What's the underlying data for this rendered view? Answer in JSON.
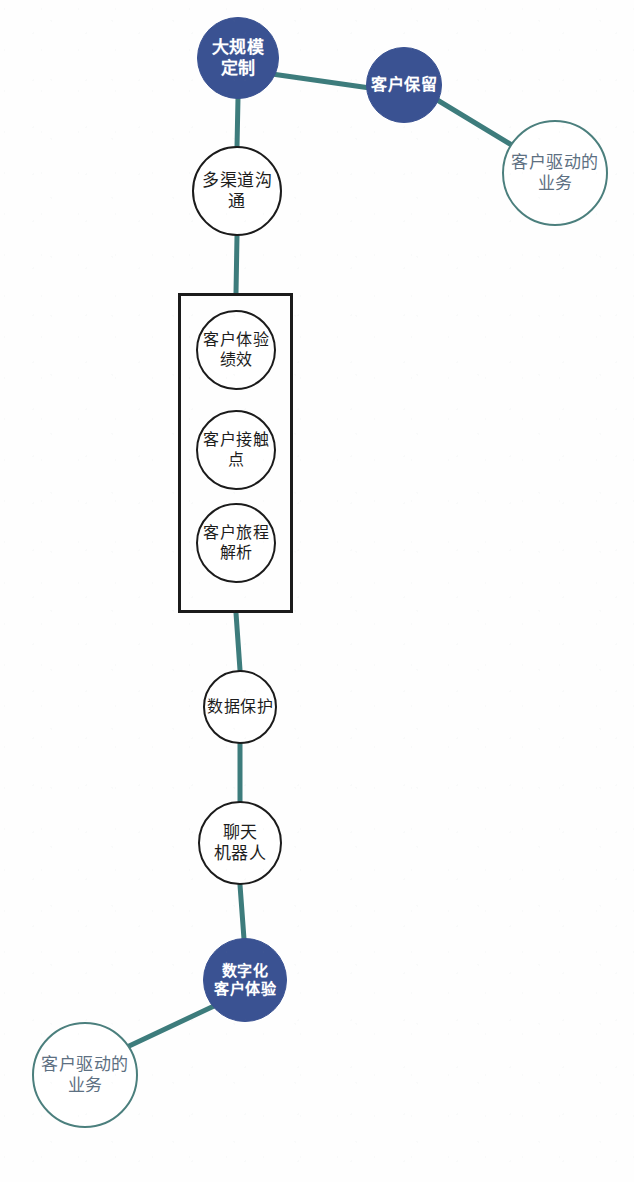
{
  "diagram": {
    "canvas": {
      "width": 634,
      "height": 1182,
      "background": "#fefefe"
    },
    "colors": {
      "filled_node_fill": "#3a5292",
      "filled_node_text": "#ffffff",
      "outline_dark_border": "#1b1b1b",
      "outline_dark_text": "#1d1d1d",
      "outline_teal_border": "#4b7f7d",
      "outline_teal_text": "#5d7082",
      "edge": "#3d7c7c",
      "group_box_border": "#1b1b1b"
    },
    "nodes": [
      {
        "id": "mass-customization",
        "label": "大规模\n定制",
        "style": "filled",
        "cx": 238,
        "cy": 58,
        "r": 41,
        "font_size": 17
      },
      {
        "id": "customer-retention",
        "label": "客户保留",
        "style": "filled",
        "cx": 404,
        "cy": 85,
        "r": 38,
        "font_size": 16
      },
      {
        "id": "customer-driven-business-top",
        "label": "客户驱动的\n业务",
        "style": "outline-teal",
        "cx": 555,
        "cy": 173,
        "r": 53,
        "font_size": 17
      },
      {
        "id": "multichannel-communication",
        "label": "多渠道沟\n通",
        "style": "outline-dark",
        "cx": 237,
        "cy": 191,
        "r": 45,
        "font_size": 17
      },
      {
        "id": "cx-performance",
        "label": "客户体验\n绩效",
        "style": "outline-dark",
        "cx": 236,
        "cy": 350,
        "r": 40,
        "font_size": 16
      },
      {
        "id": "customer-touchpoints",
        "label": "客户接触\n点",
        "style": "outline-dark",
        "cx": 236,
        "cy": 450,
        "r": 40,
        "font_size": 16
      },
      {
        "id": "customer-journey-analysis",
        "label": "客户旅程\n解析",
        "style": "outline-dark",
        "cx": 236,
        "cy": 543,
        "r": 40,
        "font_size": 16
      },
      {
        "id": "data-protection",
        "label": "数据保护",
        "style": "outline-dark",
        "cx": 240,
        "cy": 707,
        "r": 37,
        "font_size": 16
      },
      {
        "id": "chatbot",
        "label": "聊天\n机器人",
        "style": "outline-dark",
        "cx": 240,
        "cy": 843,
        "r": 42,
        "font_size": 17
      },
      {
        "id": "digital-cx",
        "label": "数字化\n客户体验",
        "style": "filled",
        "cx": 245,
        "cy": 980,
        "r": 42,
        "font_size": 15
      },
      {
        "id": "customer-driven-business-bottom",
        "label": "客户驱动的\n业务",
        "style": "outline-teal",
        "cx": 85,
        "cy": 1075,
        "r": 53,
        "font_size": 17
      }
    ],
    "edges": [
      {
        "from": "mass-customization",
        "to": "customer-retention",
        "x1": 272,
        "y1": 74,
        "x2": 370,
        "y2": 88
      },
      {
        "from": "customer-retention",
        "to": "customer-driven-business-top",
        "x1": 434,
        "y1": 98,
        "x2": 515,
        "y2": 147
      },
      {
        "from": "mass-customization",
        "to": "multichannel-communication",
        "x1": 238,
        "y1": 98,
        "x2": 237,
        "y2": 147
      },
      {
        "from": "multichannel-communication",
        "to": "group-box",
        "x1": 237,
        "y1": 236,
        "x2": 236,
        "y2": 293
      },
      {
        "from": "group-box",
        "to": "data-protection",
        "x1": 236,
        "y1": 613,
        "x2": 240,
        "y2": 670
      },
      {
        "from": "data-protection",
        "to": "chatbot",
        "x1": 240,
        "y1": 744,
        "x2": 240,
        "y2": 801
      },
      {
        "from": "chatbot",
        "to": "digital-cx",
        "x1": 240,
        "y1": 885,
        "x2": 244,
        "y2": 939
      },
      {
        "from": "digital-cx",
        "to": "customer-driven-business-bottom",
        "x1": 214,
        "y1": 1006,
        "x2": 127,
        "y2": 1047
      }
    ],
    "group_box": {
      "id": "cx-analytics-group",
      "x": 178,
      "y": 293,
      "width": 115,
      "height": 320,
      "members": [
        "cx-performance",
        "customer-touchpoints",
        "customer-journey-analysis"
      ]
    }
  }
}
